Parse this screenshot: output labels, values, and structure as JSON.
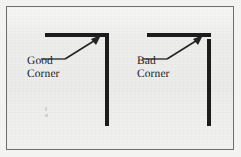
{
  "figure": {
    "kind": "technical-illustration",
    "background_color": "#f3f3f2",
    "frame_fill_color": "#ececeb",
    "frame_border_color": "#6f6f6f",
    "stroke_color": "#1d1d1d",
    "text_color": "#232323"
  },
  "examples": [
    {
      "id": "good",
      "label": "Good\nCorner",
      "label_line_1": "Good",
      "label_line_2": "Corner",
      "joint": "flush-mitered",
      "gap": "none",
      "arrow": "up-right"
    },
    {
      "id": "bad",
      "label": "Bad\nCorner",
      "label_line_1": "Bad",
      "label_line_2": "Corner",
      "joint": "offset-overlap",
      "gap": "visible-notch",
      "arrow": "up-right"
    }
  ],
  "annotations": {
    "good_arrow_name": "leader-arrow-to-good-corner",
    "bad_arrow_name": "leader-arrow-to-bad-corner"
  }
}
